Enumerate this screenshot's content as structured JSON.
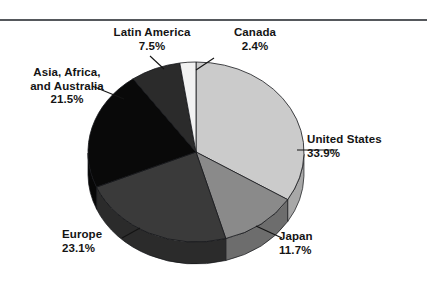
{
  "figure": {
    "name": "world-share-pie-figure",
    "has_top_rule": true,
    "rule_color": "#55585c",
    "background": "#ffffff"
  },
  "chart_data": {
    "type": "pie",
    "title": "",
    "subtitle": "",
    "xlabel": "",
    "ylabel": "",
    "legend_position": "callout-labels",
    "grid": false,
    "three_d": true,
    "start_angle_deg": -90,
    "direction": "clockwise",
    "total_percent": 100.1,
    "categories": [
      "United States",
      "Japan",
      "Europe",
      "Asia, Africa, and Australia",
      "Latin America",
      "Canada"
    ],
    "values": [
      33.9,
      11.7,
      23.1,
      21.5,
      7.5,
      2.4
    ],
    "slices": [
      {
        "id": "united-states",
        "label": "United States",
        "label_lines": [
          "United States"
        ],
        "percent_text": "33.9%",
        "value": 33.9,
        "color": "#cbcbcb",
        "side_color": "#a8a8a8",
        "leader": true
      },
      {
        "id": "japan",
        "label": "Japan",
        "label_lines": [
          "Japan"
        ],
        "percent_text": "11.7%",
        "value": 11.7,
        "color": "#8a8a8a",
        "side_color": "#6d6d6d",
        "leader": true
      },
      {
        "id": "europe",
        "label": "Europe",
        "label_lines": [
          "Europe"
        ],
        "percent_text": "23.1%",
        "value": 23.1,
        "color": "#3a3a3a",
        "side_color": "#2b2b2b",
        "leader": true
      },
      {
        "id": "asia-africa-australia",
        "label": "Asia, Africa, and Australia",
        "label_lines": [
          "Asia, Africa,",
          "and Australia"
        ],
        "percent_text": "21.5%",
        "value": 21.5,
        "color": "#090909",
        "side_color": "#070707",
        "leader": true
      },
      {
        "id": "latin-america",
        "label": "Latin America",
        "label_lines": [
          "Latin America"
        ],
        "percent_text": "7.5%",
        "value": 7.5,
        "color": "#2b2b2b",
        "side_color": "#202020",
        "leader": true
      },
      {
        "id": "canada",
        "label": "Canada",
        "label_lines": [
          "Canada"
        ],
        "percent_text": "2.4%",
        "value": 2.4,
        "color": "#f2f2f2",
        "side_color": "#d2d2d2",
        "leader": true
      }
    ],
    "geometry": {
      "cx": 196,
      "cy": 152,
      "rx": 108,
      "ry": 90,
      "depth": 22
    }
  },
  "labels": {
    "latin_america": {
      "line1": "Latin America",
      "percent": "7.5%"
    },
    "canada": {
      "line1": "Canada",
      "percent": "2.4%"
    },
    "asia": {
      "line1": "Asia, Africa,",
      "line2": "and Australia",
      "percent": "21.5%"
    },
    "united_states": {
      "line1": "United States",
      "percent": "33.9%"
    },
    "japan": {
      "line1": "Japan",
      "percent": "11.7%"
    },
    "europe": {
      "line1": "Europe",
      "percent": "23.1%"
    }
  }
}
